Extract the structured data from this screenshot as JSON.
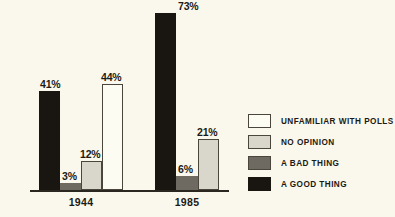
{
  "chart_data": {
    "type": "bar",
    "title": "",
    "subtitle": "",
    "xlabel": "",
    "ylabel": "",
    "ylim": [
      0,
      80
    ],
    "grid": false,
    "legend_position": "right",
    "categories": [
      "1944",
      "1985"
    ],
    "series": [
      {
        "name": "A GOOD THING",
        "key": "good",
        "color": "#191510",
        "values": [
          41,
          73
        ],
        "labels": [
          "41%",
          "73%"
        ]
      },
      {
        "name": "A BAD THING",
        "key": "bad",
        "color": "#6e6a61",
        "values": [
          3,
          6
        ],
        "labels": [
          "3%",
          "6%"
        ]
      },
      {
        "name": "NO OPINION",
        "key": "noop",
        "color": "#d9d7cb",
        "values": [
          12,
          21
        ],
        "labels": [
          "12%",
          "21%"
        ]
      },
      {
        "name": "UNFAMILIAR WITH POLLS",
        "key": "unfam",
        "color": "#fdfcf3",
        "values": [
          44,
          null
        ],
        "labels": [
          "44%",
          null
        ]
      }
    ],
    "annotations": []
  },
  "legend": {
    "items": [
      {
        "label": "UNFAMILIAR WITH POLLS",
        "swatch": "unfam"
      },
      {
        "label": "NO OPINION",
        "swatch": "noop"
      },
      {
        "label": "A BAD THING",
        "swatch": "bad"
      },
      {
        "label": "A GOOD THING",
        "swatch": "good"
      }
    ]
  },
  "axis": {
    "group_labels": [
      "1944",
      "1985"
    ]
  },
  "bars": {
    "g1944": [
      {
        "series": "good",
        "value": 41,
        "label": "41%"
      },
      {
        "series": "bad",
        "value": 3,
        "label": "3%"
      },
      {
        "series": "noop",
        "value": 12,
        "label": "12%"
      },
      {
        "series": "unfam",
        "value": 44,
        "label": "44%"
      }
    ],
    "g1985": [
      {
        "series": "good",
        "value": 73,
        "label": "73%"
      },
      {
        "series": "bad",
        "value": 6,
        "label": "6%"
      },
      {
        "series": "noop",
        "value": 21,
        "label": "21%"
      }
    ]
  },
  "colors": {
    "background": "#faf8ec",
    "ink": "#1d1a14",
    "axis": "#2a2720"
  }
}
